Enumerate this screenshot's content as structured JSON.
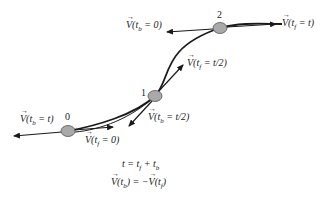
{
  "diagram": {
    "type": "trajectory-velocity-diagram",
    "nodes": [
      {
        "id": "0",
        "label": "0",
        "x": 68,
        "y": 131
      },
      {
        "id": "1",
        "label": "1",
        "x": 155,
        "y": 96
      },
      {
        "id": "2",
        "label": "2",
        "x": 220,
        "y": 28
      }
    ],
    "node_color": "#a9a9a9",
    "line_color": "#1a1a1a",
    "vectors": [
      {
        "node": "0",
        "direction": "backward",
        "label_pre": "V",
        "label_arg": "(t",
        "label_sub": "b",
        "label_post": " = t)"
      },
      {
        "node": "0",
        "direction": "forward",
        "label_pre": "V",
        "label_arg": "(t",
        "label_sub": "f",
        "label_post": " = 0)"
      },
      {
        "node": "1",
        "direction": "backward",
        "label_pre": "V",
        "label_arg": "(t",
        "label_sub": "b",
        "label_post": " = t/2)"
      },
      {
        "node": "1",
        "direction": "forward",
        "label_pre": "V",
        "label_arg": "(t",
        "label_sub": "f",
        "label_post": " = t/2)"
      },
      {
        "node": "2",
        "direction": "backward",
        "label_pre": "V",
        "label_arg": "(t",
        "label_sub": "b",
        "label_post": " = 0)"
      },
      {
        "node": "2",
        "direction": "forward",
        "label_pre": "V",
        "label_arg": "(t",
        "label_sub": "f",
        "label_post": " = t)"
      }
    ],
    "equations": {
      "line1": "t = t",
      "line1_sub1": "f",
      "line1_mid": " + t",
      "line1_sub2": "b",
      "line2_pre": "V",
      "line2_arg": "(t",
      "line2_sub": "b",
      "line2_mid": ") = −",
      "line2_v2": "V",
      "line2_arg2": "(t",
      "line2_sub2": "f",
      "line2_post": ")"
    }
  }
}
